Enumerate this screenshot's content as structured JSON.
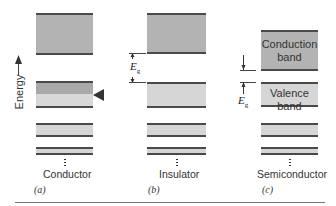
{
  "axis": {
    "label": "Energy",
    "direction": "up"
  },
  "panels": [
    {
      "id": "a",
      "label": "Conductor",
      "panel_label": "(a)",
      "bands": [
        {
          "role": "upper-band",
          "fill": "empty"
        },
        {
          "role": "partially-filled-band",
          "fill": "partial",
          "fermi_marker": true
        },
        {
          "role": "lower-band-1",
          "fill": "filled"
        },
        {
          "role": "lower-band-2",
          "fill": "filled"
        }
      ]
    },
    {
      "id": "b",
      "label": "Insulator",
      "panel_label": "(b)",
      "gap_label": {
        "symbol": "E",
        "subscript": "g"
      },
      "bands": [
        {
          "role": "conduction-band",
          "fill": "empty"
        },
        {
          "role": "valence-band",
          "fill": "filled"
        },
        {
          "role": "lower-band-1",
          "fill": "filled"
        },
        {
          "role": "lower-band-2",
          "fill": "filled"
        }
      ]
    },
    {
      "id": "c",
      "label": "Semiconductor",
      "panel_label": "(c)",
      "gap_label": {
        "symbol": "E",
        "subscript": "g"
      },
      "bands": [
        {
          "role": "conduction-band",
          "fill": "empty",
          "text_line1": "Conduction",
          "text_line2": "band"
        },
        {
          "role": "valence-band",
          "fill": "filled",
          "text_line1": "Valence",
          "text_line2": "band"
        },
        {
          "role": "lower-band-1",
          "fill": "filled"
        },
        {
          "role": "lower-band-2",
          "fill": "filled"
        }
      ]
    }
  ],
  "colors": {
    "empty_band": "#b3b3b3",
    "filled_band": "#d6d6d6",
    "band_edge": "#4a4a4a"
  }
}
